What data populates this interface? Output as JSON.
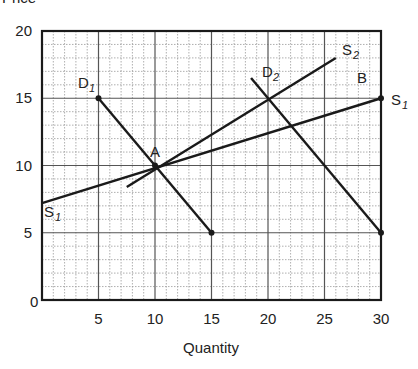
{
  "chart_data": {
    "type": "line",
    "title": "",
    "xlabel": "Quantity",
    "ylabel": "Price",
    "xlim": [
      0,
      30
    ],
    "ylim": [
      0,
      20
    ],
    "x_ticks": [
      5,
      10,
      15,
      20,
      25,
      30
    ],
    "y_ticks": [
      0,
      5,
      10,
      15,
      20
    ],
    "grid": {
      "major": true,
      "minor": true,
      "major_step": 5,
      "minor_step": 1
    },
    "series": [
      {
        "name": "D1",
        "label": "D",
        "sub": "1",
        "points": [
          [
            5,
            15
          ],
          [
            15,
            5
          ]
        ],
        "dots": [
          [
            5,
            15
          ],
          [
            15,
            5
          ]
        ]
      },
      {
        "name": "D2",
        "label": "D",
        "sub": "2",
        "points": [
          [
            18.5,
            16.5
          ],
          [
            30,
            5
          ]
        ],
        "dots": [
          [
            30,
            5
          ]
        ]
      },
      {
        "name": "S1",
        "label": "S",
        "sub": "1",
        "points": [
          [
            0,
            7.2
          ],
          [
            30,
            15
          ]
        ],
        "dots": [
          [
            30,
            15
          ]
        ]
      },
      {
        "name": "S2",
        "label": "S",
        "sub": "2",
        "points": [
          [
            7.5,
            8.4
          ],
          [
            26,
            18
          ]
        ],
        "dots": []
      }
    ],
    "annotations": [
      {
        "text": "A",
        "x": 10,
        "y": 10,
        "dot": true
      },
      {
        "text": "B",
        "x": 30,
        "y": 15
      }
    ]
  },
  "labels": {
    "y_axis": "Price",
    "x_axis": "Quantity",
    "origin": "0",
    "point_a": "A",
    "point_b": "B",
    "d1_main": "D",
    "d1_sub": "1",
    "d2_main": "D",
    "d2_sub": "2",
    "s1_left_main": "S",
    "s1_left_sub": "1",
    "s1_right_main": "S",
    "s1_right_sub": "1",
    "s2_main": "S",
    "s2_sub": "2"
  },
  "colors": {
    "line": "#1a1a1a",
    "major_grid": "#555555",
    "minor_grid": "#9a9a9a",
    "frame": "#1a1a1a"
  }
}
